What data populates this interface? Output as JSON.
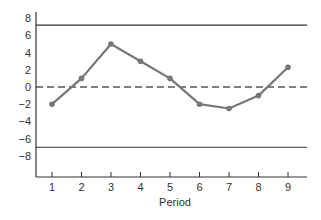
{
  "chart_data": {
    "type": "line",
    "title": "",
    "xlabel": "Period",
    "ylabel": "",
    "x": [
      1,
      2,
      3,
      4,
      5,
      6,
      7,
      8,
      9
    ],
    "series": [
      {
        "name": "Observed values",
        "values": [
          -2,
          1,
          5,
          3,
          1,
          -2,
          -2.5,
          -1,
          2.3
        ],
        "color": "#777777",
        "markers": true
      }
    ],
    "reference_lines": [
      {
        "name": "Upper control limit",
        "value": 7.2,
        "style": "solid",
        "color": "#333333"
      },
      {
        "name": "Center line",
        "value": 0,
        "style": "dashed",
        "color": "#555555"
      },
      {
        "name": "Lower control limit",
        "value": -7,
        "style": "solid",
        "color": "#333333"
      }
    ],
    "x_ticks": [
      "1",
      "2",
      "3",
      "4",
      "5",
      "6",
      "7",
      "8",
      "9"
    ],
    "y_ticks": [
      "8",
      "6",
      "4",
      "2",
      "0",
      "−2",
      "−4",
      "−6",
      "−8"
    ],
    "y_tick_values": [
      8,
      6,
      4,
      2,
      0,
      -2,
      -4,
      -6,
      -8
    ],
    "xlim": [
      0.5,
      9.7
    ],
    "ylim": [
      -10.4,
      8.2
    ],
    "grid": false,
    "legend": null
  }
}
